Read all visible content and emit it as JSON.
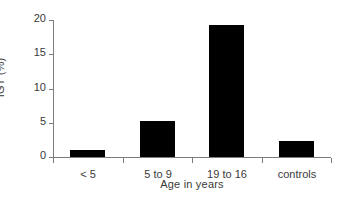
{
  "chart_data": {
    "type": "bar",
    "title": "",
    "subtitle": "",
    "xlabel": "Age in years",
    "ylabel": "IGT (%)",
    "categories": [
      "< 5",
      "5 to 9",
      "19 to 16",
      "controls"
    ],
    "values": [
      1.0,
      5.3,
      19.3,
      2.3
    ],
    "ylim": [
      0,
      20
    ],
    "ytick_labels": [
      "0",
      "5",
      "10",
      "15",
      "20"
    ],
    "ytick_values": [
      0,
      5,
      10,
      15,
      20
    ],
    "grid": false,
    "legend": false,
    "legend_position": "none",
    "bar_color": "#000000",
    "axis_color": "#7c7c7c",
    "text_color": "#3a3a3a",
    "background_color": "#ffffff"
  }
}
